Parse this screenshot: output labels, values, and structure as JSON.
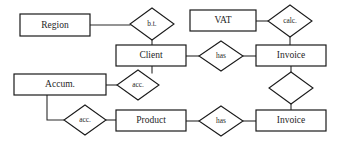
{
  "diagram": {
    "type": "entity-relationship-diagram",
    "background_color": "#ffffff",
    "line_color": "#2a2a2a",
    "text_color": "#262626",
    "entities": [
      {
        "id": "region",
        "label": "Region",
        "x": 20,
        "y": 14,
        "w": 70,
        "h": 22
      },
      {
        "id": "vat",
        "label": "VAT",
        "x": 190,
        "y": 10,
        "w": 66,
        "h": 21
      },
      {
        "id": "client",
        "label": "Client",
        "x": 116,
        "y": 45,
        "w": 70,
        "h": 21
      },
      {
        "id": "invoice1",
        "label": "Invoice",
        "x": 256,
        "y": 45,
        "w": 70,
        "h": 21
      },
      {
        "id": "accum",
        "label": "Accum.",
        "x": 14,
        "y": 74,
        "w": 92,
        "h": 21
      },
      {
        "id": "product",
        "label": "Product",
        "x": 116,
        "y": 110,
        "w": 70,
        "h": 21
      },
      {
        "id": "invoice2",
        "label": "Invoice",
        "x": 256,
        "y": 110,
        "w": 70,
        "h": 21
      }
    ],
    "relationships": [
      {
        "id": "bt",
        "label": "b.t.",
        "cx": 152,
        "cy": 24,
        "rx": 22,
        "ry": 16
      },
      {
        "id": "calc",
        "label": "calc.",
        "cx": 290,
        "cy": 21,
        "rx": 22,
        "ry": 16
      },
      {
        "id": "has-top",
        "label": "has",
        "cx": 221,
        "cy": 56,
        "rx": 22,
        "ry": 15
      },
      {
        "id": "acc-mid",
        "label": "acc.",
        "cx": 138,
        "cy": 85,
        "rx": 21,
        "ry": 15
      },
      {
        "id": "inv-link",
        "label": "",
        "cx": 291,
        "cy": 88,
        "rx": 22,
        "ry": 16
      },
      {
        "id": "acc-low",
        "label": "acc.",
        "cx": 85,
        "cy": 120,
        "rx": 21,
        "ry": 15
      },
      {
        "id": "has-bot",
        "label": "has",
        "cx": 221,
        "cy": 121,
        "rx": 22,
        "ry": 15
      }
    ],
    "edges": [
      {
        "id": "region-bt",
        "from": "region",
        "to": "bt",
        "path": "M90,25 L130,25"
      },
      {
        "id": "bt-client",
        "from": "bt",
        "to": "client",
        "path": "M152,40 L152,45"
      },
      {
        "id": "vat-calc",
        "from": "vat",
        "to": "calc",
        "path": "M256,21 L268,21"
      },
      {
        "id": "calc-invoice1",
        "from": "calc",
        "to": "invoice1",
        "path": "M290,37 L290,45"
      },
      {
        "id": "client-has",
        "from": "client",
        "to": "has-top",
        "path": "M186,56 L199,56"
      },
      {
        "id": "has-invoice1",
        "from": "has-top",
        "to": "invoice1",
        "path": "M243,56 L256,56"
      },
      {
        "id": "client-acc",
        "from": "client",
        "to": "acc-mid",
        "path": "M152,66 L152,73"
      },
      {
        "id": "accum-acc",
        "from": "accum",
        "to": "acc-mid",
        "path": "M106,85 L117,85"
      },
      {
        "id": "invoice1-link",
        "from": "invoice1",
        "to": "inv-link",
        "path": "M291,66 L291,72"
      },
      {
        "id": "link-invoice2",
        "from": "inv-link",
        "to": "invoice2",
        "path": "M291,104 L291,110"
      },
      {
        "id": "accum-acclow",
        "from": "accum",
        "to": "acc-low",
        "path": "M47,95 L47,120 L64,120"
      },
      {
        "id": "acclow-product",
        "from": "acc-low",
        "to": "product",
        "path": "M106,120 L116,120"
      },
      {
        "id": "product-hasbot",
        "from": "product",
        "to": "has-bot",
        "path": "M186,121 L199,121"
      },
      {
        "id": "hasbot-invoice2",
        "from": "has-bot",
        "to": "invoice2",
        "path": "M243,121 L256,121"
      }
    ]
  }
}
